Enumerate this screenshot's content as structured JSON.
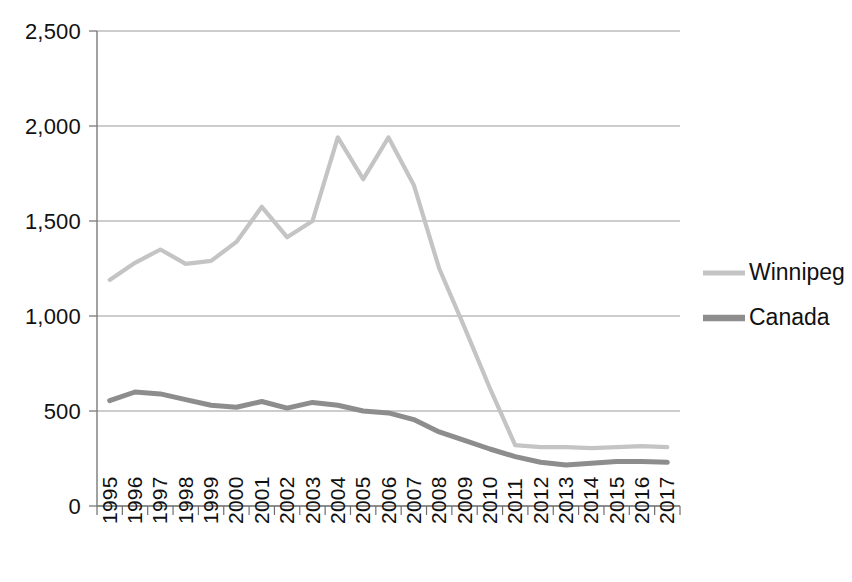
{
  "chart_data": {
    "type": "line",
    "title": "",
    "subtitle": "",
    "xlabel": "",
    "ylabel": "",
    "categories": [
      "1995",
      "1996",
      "1997",
      "1998",
      "1999",
      "2000",
      "2001",
      "2002",
      "2003",
      "2004",
      "2005",
      "2006",
      "2007",
      "2008",
      "2009",
      "2010",
      "2011",
      "2012",
      "2013",
      "2014",
      "2015",
      "2016",
      "2017"
    ],
    "x": [
      1995,
      1996,
      1997,
      1998,
      1999,
      2000,
      2001,
      2002,
      2003,
      2004,
      2005,
      2006,
      2007,
      2008,
      2009,
      2010,
      2011,
      2012,
      2013,
      2014,
      2015,
      2016,
      2017
    ],
    "series": [
      {
        "name": "Winnipeg",
        "color": "#c4c4c4",
        "values": [
          1190,
          1280,
          1350,
          1275,
          1290,
          1390,
          1575,
          1415,
          1500,
          1940,
          1720,
          1940,
          1690,
          1250,
          940,
          620,
          320,
          310,
          310,
          305,
          310,
          315,
          310
        ]
      },
      {
        "name": "Canada",
        "color": "#8d8d8d",
        "values": [
          555,
          600,
          590,
          560,
          530,
          520,
          550,
          515,
          545,
          530,
          500,
          490,
          455,
          390,
          345,
          300,
          260,
          230,
          215,
          225,
          235,
          235,
          230
        ]
      }
    ],
    "ylim": [
      0,
      2500
    ],
    "ytick_values": [
      0,
      500,
      1000,
      1500,
      2000,
      2500
    ],
    "ytick_labels": [
      "0",
      "500",
      "1,000",
      "1,500",
      "2,000",
      "2,500"
    ],
    "grid": true,
    "grid_axis": "y",
    "legend_position": "right",
    "legend": [
      {
        "label": "Winnipeg",
        "color": "#c4c4c4"
      },
      {
        "label": "Canada",
        "color": "#8d8d8d"
      }
    ],
    "annotations": []
  },
  "colors": {
    "winnipeg": "#c4c4c4",
    "canada": "#8d8d8d",
    "gridline": "#9a9a9a",
    "axis": "#7a7a7a",
    "text": "#111111",
    "background": "#ffffff"
  }
}
